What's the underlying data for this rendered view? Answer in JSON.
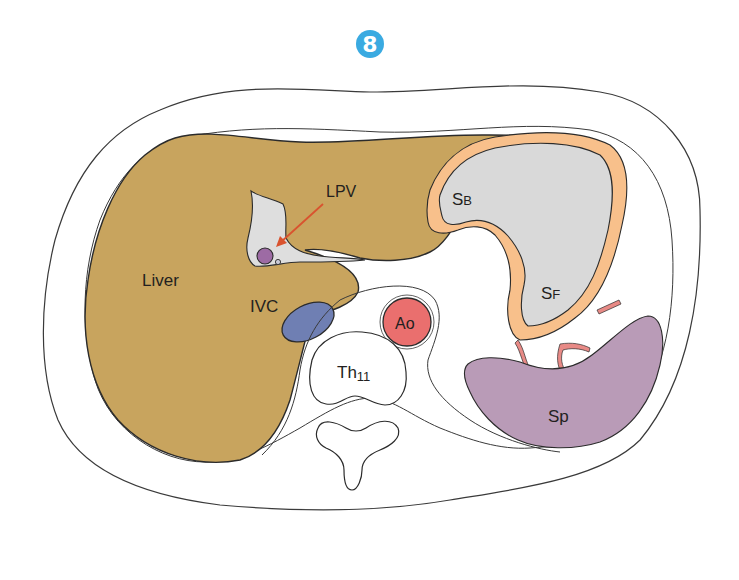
{
  "figure": {
    "number": "8",
    "number_badge_color": "#3aaae1"
  },
  "labels": {
    "liver": "Liver",
    "lpv": "LPV",
    "ivc": "IVC",
    "ao": "Ao",
    "th": "Th",
    "th_sub": "11",
    "sb_main": "S",
    "sb_sub": "B",
    "sf_main": "S",
    "sf_sub": "F",
    "sp": "Sp"
  },
  "colors": {
    "liver": "#c8a45e",
    "ivc": "#6f7fb3",
    "aorta": "#ea6f6e",
    "lpv_region": "#dedede",
    "lpv_vessel": "#9d6ba4",
    "stomach_wall": "#f8c08b",
    "stomach_lumen": "#d9d9d9",
    "spleen": "#b99bb7",
    "vessels": "#e88a86",
    "arrow": "#d9532f",
    "outline": "#2b2b2b"
  }
}
